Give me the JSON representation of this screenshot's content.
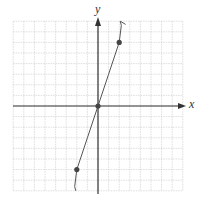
{
  "chart_data": {
    "type": "line",
    "title": "",
    "xlabel": "x",
    "ylabel": "y",
    "grid": true,
    "xlim": [
      -8,
      8
    ],
    "ylim": [
      -8,
      8
    ],
    "tick_labels": false,
    "series": [
      {
        "name": "curve",
        "points": [
          [
            -2.1,
            -8.0
          ],
          [
            -2.2,
            -7.6
          ],
          [
            -2.0,
            -6.0
          ],
          [
            -1.0,
            -3.0
          ],
          [
            0,
            0
          ],
          [
            1.0,
            3.0
          ],
          [
            2.0,
            6.0
          ],
          [
            2.2,
            7.6
          ],
          [
            2.1,
            8.0
          ],
          [
            2.6,
            7.7
          ]
        ],
        "marked_points": [
          [
            -2,
            -6
          ],
          [
            0,
            0
          ],
          [
            2,
            6
          ]
        ]
      }
    ],
    "colors": {
      "grid": "#c8c8c8",
      "axis": "#333333",
      "curve": "#555555",
      "point": "#444444"
    }
  },
  "labels": {
    "x": "x",
    "y": "y"
  }
}
